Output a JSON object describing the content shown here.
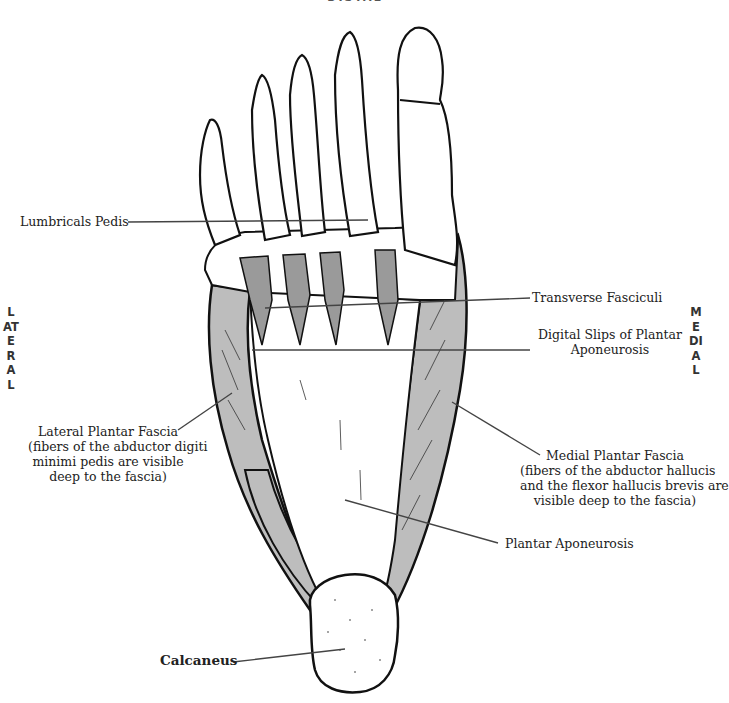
{
  "orientation": {
    "top": "DISTAL",
    "left": "LATERAL",
    "right": "MEDIAL"
  },
  "labels": {
    "lumbricals": "Lumbricals Pedis",
    "transverse": "Transverse Fasciculi",
    "digital_slips_line1": "Digital Slips of Plantar",
    "digital_slips_line2": "Aponeurosis",
    "lateral_title": "Lateral Plantar Fascia",
    "lateral_line1": "(fibers of the abductor digiti",
    "lateral_line2": "minimi pedis are visible",
    "lateral_line3": "deep to the fascia)",
    "medial_title": "Medial Plantar Fascia",
    "medial_line1": "(fibers of the abductor hallucis",
    "medial_line2": "and the flexor hallucis brevis are",
    "medial_line3": "visible deep to the fascia)",
    "plantar": "Plantar Aponeurosis",
    "calcaneus": "Calcaneus"
  },
  "colors": {
    "muscle_fill": "#bdbdbd",
    "outline": "#111111",
    "leader": "#444444"
  }
}
